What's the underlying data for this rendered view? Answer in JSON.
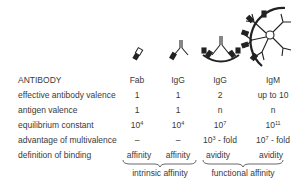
{
  "columns": [
    {
      "header": "Fab",
      "icon": "fab-fragment-icon"
    },
    {
      "header": "IgG",
      "icon": "igg-monovalent-icon"
    },
    {
      "header": "IgG",
      "icon": "igg-bivalent-bound-icon"
    },
    {
      "header": "IgM",
      "icon": "igm-pentamer-bound-icon"
    }
  ],
  "rows": [
    {
      "label": "ANTIBODY"
    },
    {
      "label": "effective antibody valence",
      "values": [
        "1",
        "1",
        "2",
        "up to 10"
      ]
    },
    {
      "label": "antigen valence",
      "values": [
        "1",
        "1",
        "n",
        "n"
      ]
    },
    {
      "label": "equilibrium constant",
      "values": [
        {
          "base": "10",
          "exp": "4"
        },
        {
          "base": "10",
          "exp": "4"
        },
        {
          "base": "10",
          "exp": "7"
        },
        {
          "base": "10",
          "exp": "11"
        }
      ]
    },
    {
      "label": "advantage of multivalence",
      "values": [
        {
          "text": "–"
        },
        {
          "text": "–"
        },
        {
          "base": "10",
          "exp": "3",
          "suffix": " - fold"
        },
        {
          "base": "10",
          "exp": "7",
          "suffix": " - fold"
        }
      ]
    },
    {
      "label": "definition of binding",
      "values": [
        "affinity",
        "affinity",
        "avidity",
        "avidity"
      ]
    }
  ],
  "groups": [
    {
      "label": "intrinsic affinity",
      "span": "Fab–IgG"
    },
    {
      "label": "functional affinity",
      "span": "IgG–IgM"
    }
  ],
  "colors": {
    "text": "#3a3a3a",
    "icon": "#2a2a2a"
  }
}
